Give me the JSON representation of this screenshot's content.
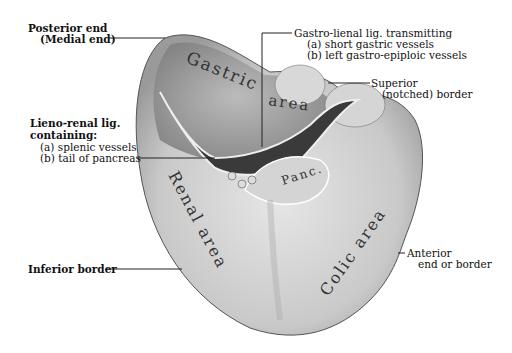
{
  "figure": {
    "labels": {
      "posterior_end": "Posterior end",
      "medial_end": "(Medial end)",
      "gastro_lienal": "Gastro-lienal lig. transmitting",
      "gastro_lienal_a": "(a) short gastric vessels",
      "gastro_lienal_b": "(b) left gastro-epiploic vessels",
      "superior": "Superior",
      "superior_2": "(notched) border",
      "lieno_renal": "Lieno-renal lig.",
      "lieno_renal_2": "containing:",
      "lieno_renal_a": "(a) splenic vessels",
      "lieno_renal_b": "(b) tail of pancreas",
      "inferior_border": "Inferior border",
      "anterior": "Anterior",
      "anterior_2": "end or border"
    },
    "areas": {
      "gastric": "Gastric",
      "gastric_2": "area",
      "renal": "Renal area",
      "colic": "Colic area",
      "pancreas": "Panc."
    }
  }
}
